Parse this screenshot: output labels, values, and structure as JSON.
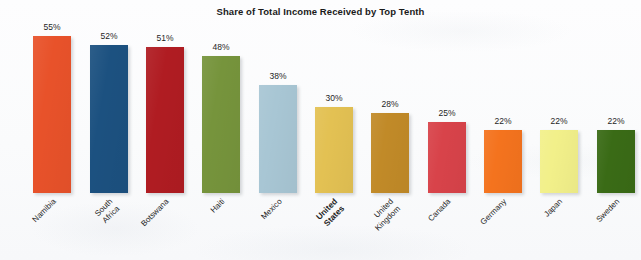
{
  "chart_data": {
    "type": "bar",
    "title": "Share of Total Income Received by Top Tenth",
    "xlabel": "",
    "ylabel": "",
    "ylim": [
      0,
      55
    ],
    "grid": false,
    "legend": "none",
    "value_label_suffix": "%",
    "categories": [
      "Namibia",
      "South Africa",
      "Botswana",
      "Haiti",
      "Mexico",
      "United States",
      "United\nKingdom",
      "Canada",
      "Germany",
      "Japan",
      "Sweden"
    ],
    "values": [
      55,
      52,
      51,
      48,
      38,
      30,
      28,
      25,
      22,
      22,
      22
    ],
    "value_labels": [
      "55%",
      "52%",
      "51%",
      "48%",
      "38%",
      "30%",
      "28%",
      "25%",
      "22%",
      "22%",
      "22%"
    ],
    "colors": [
      "#e8522a",
      "#1c5180",
      "#b01c22",
      "#76943c",
      "#a8c6d4",
      "#e3c153",
      "#c18a28",
      "#d8434a",
      "#f4731e",
      "#f2f08a",
      "#3a6b16"
    ],
    "highlighted_category": "United States",
    "bar_left_positions": [
      33,
      90,
      146,
      202,
      259,
      315,
      371,
      428,
      484,
      540,
      597
    ],
    "bar_width": 38,
    "baseline_y": 193,
    "pixels_per_unit": 2.855
  },
  "page": {
    "background_color": "#fbfbfc",
    "text_color": "#1f1f1f"
  }
}
